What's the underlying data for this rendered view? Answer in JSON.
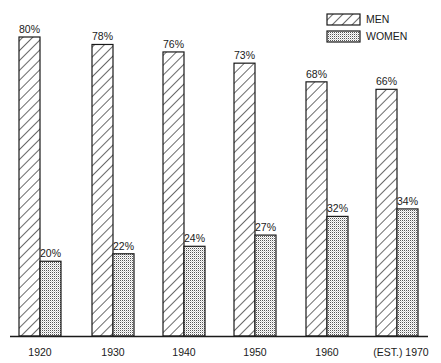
{
  "chart_data": {
    "type": "bar",
    "title": "",
    "xlabel": "",
    "ylabel": "",
    "categories": [
      "1920",
      "1930",
      "1940",
      "1950",
      "1960",
      "(EST.) 1970"
    ],
    "series": [
      {
        "name": "MEN",
        "pattern": "diagonal-hatch",
        "values": [
          80,
          78,
          76,
          73,
          68,
          66
        ],
        "labels": [
          "80%",
          "78%",
          "76%",
          "73%",
          "68%",
          "66%"
        ]
      },
      {
        "name": "WOMEN",
        "pattern": "dotted-grid",
        "values": [
          20,
          22,
          24,
          27,
          32,
          34
        ],
        "labels": [
          "20%",
          "22%",
          "24%",
          "27%",
          "32%",
          "34%"
        ]
      }
    ],
    "ylim": [
      0,
      80
    ],
    "grid": false,
    "legend_position": "top-right",
    "value_unit": "%"
  },
  "legend": {
    "men_label": "MEN",
    "women_label": "WOMEN"
  },
  "colors": {
    "ink": "#1a1a1a",
    "background": "#ffffff"
  }
}
